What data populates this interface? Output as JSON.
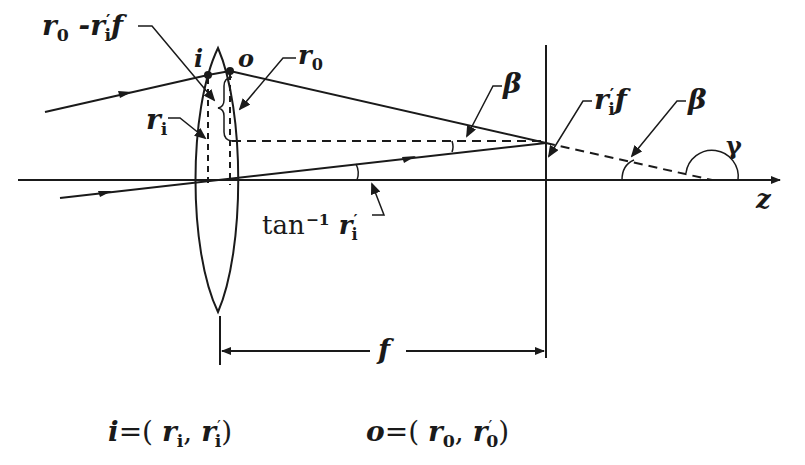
{
  "diagram": {
    "title": "",
    "labels": {
      "r0_minus_r1f": {
        "main": "r",
        "sub0": "0",
        "dash": " -",
        "r": "r",
        "prime": "′",
        "sub1": "i",
        "f": "f"
      },
      "i_point": "i",
      "o_point": "o",
      "r0": {
        "main": "r",
        "sub": "0"
      },
      "ri": {
        "main": "r",
        "sub": "i"
      },
      "beta_left": "β",
      "beta_right": "β",
      "rif": {
        "main": "r",
        "prime": "′",
        "sub": "i",
        "f": "f"
      },
      "gamma": "γ",
      "z_axis": "z",
      "tan_label": {
        "func": "tan",
        "exp": "−1",
        "main": "r",
        "prime": "′",
        "sub": "i"
      },
      "focal_length": "f"
    },
    "equations": {
      "i_def": {
        "lhs": "i",
        "eq": "=",
        "open": "(",
        "r1": "r",
        "r1_sub": "i",
        "comma": ",",
        "r2": "r",
        "r2_prime": "′",
        "r2_sub": "i",
        "close": ")"
      },
      "o_def": {
        "lhs": "o",
        "eq": "=",
        "open": "(",
        "r1": "r",
        "r1_sub": "0",
        "comma": ",",
        "r2": "r",
        "r2_prime": "′",
        "r2_sub": "0",
        "close": ")"
      }
    },
    "colors": {
      "line": "#1a1a1a",
      "background": "#ffffff"
    }
  }
}
